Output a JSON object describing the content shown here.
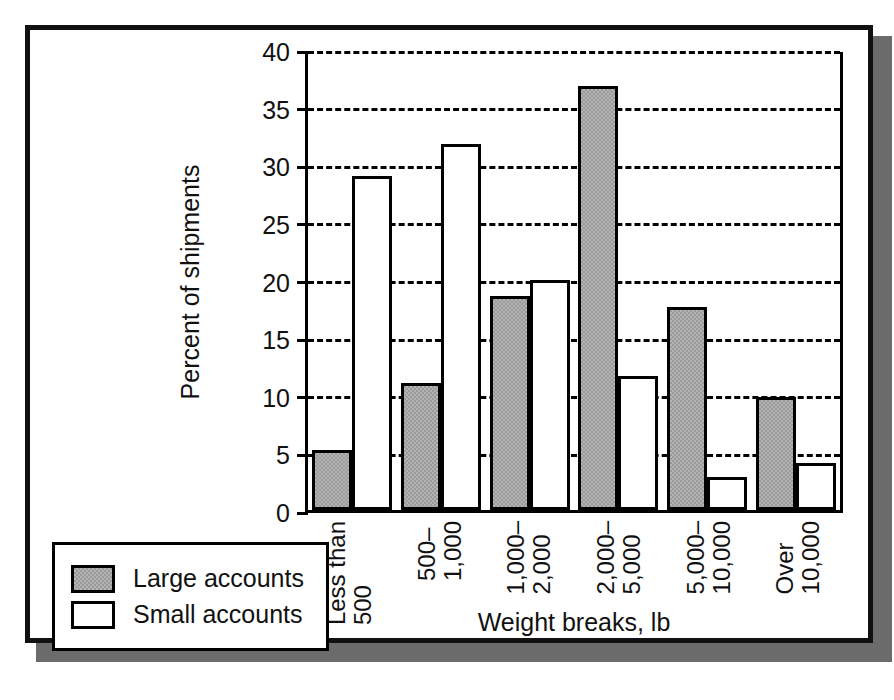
{
  "figure": {
    "background_color": "#ffffff",
    "frame_color": "#111111",
    "shadow_color": "#6b6b6b"
  },
  "legend": {
    "position": "bottom-left",
    "entries": [
      {
        "label": "Large accounts",
        "color": "#9a9a9a",
        "swatch": "gray-dither-swatch"
      },
      {
        "label": "Small accounts",
        "color": "#ffffff",
        "swatch": "white-swatch"
      }
    ]
  },
  "chart_data": {
    "type": "bar",
    "title": "",
    "xlabel": "Weight breaks, lb",
    "ylabel": "Percent of shipments",
    "ylim": [
      0,
      40
    ],
    "yticks": [
      0,
      5,
      10,
      15,
      20,
      25,
      30,
      35,
      40
    ],
    "ytick_labels": [
      "0",
      "5",
      "10",
      "15",
      "20",
      "25",
      "30",
      "35",
      "40"
    ],
    "grid": "horizontal-dashed",
    "legend_position": "bottom-left",
    "categories": [
      "Less than\n500",
      "500–\n1,000",
      "1,000–\n2,000",
      "2,000–\n5,000",
      "5,000–\n10,000",
      "Over\n10,000"
    ],
    "series": [
      {
        "name": "Large accounts",
        "color": "#9a9a9a",
        "values": [
          5.2,
          11.0,
          18.6,
          36.8,
          17.6,
          9.8
        ]
      },
      {
        "name": "Small accounts",
        "color": "#ffffff",
        "values": [
          29.0,
          31.8,
          20.0,
          11.6,
          2.9,
          4.1
        ]
      }
    ]
  }
}
